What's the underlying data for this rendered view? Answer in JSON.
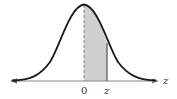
{
  "diagram": {
    "type": "normal-distribution",
    "shaded_region": {
      "from": "0",
      "to": "z",
      "color": "#cfcfcf"
    },
    "axis": {
      "label": "z",
      "color": "#888888"
    },
    "curve_color": "#1a1a1a",
    "ticks": [
      {
        "label": "0",
        "x": 84
      },
      {
        "label": "z",
        "x": 107
      }
    ]
  }
}
